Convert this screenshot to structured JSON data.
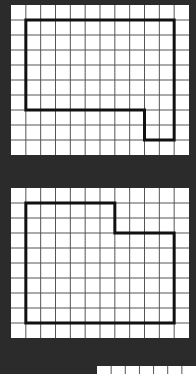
{
  "colors": {
    "background": "#2b2b2b",
    "grid_bg": "#ffffff",
    "grid_line": "#555555",
    "outline": "#111111"
  },
  "grid": {
    "cols": 12,
    "rows": 10
  },
  "panels": [
    {
      "id": "panel-1",
      "x": 11,
      "y": 5,
      "width": 178,
      "height": 150,
      "shape_points": [
        [
          1,
          1
        ],
        [
          11,
          1
        ],
        [
          11,
          9
        ],
        [
          9,
          9
        ],
        [
          9,
          7
        ],
        [
          1,
          7
        ]
      ]
    },
    {
      "id": "panel-2",
      "x": 11,
      "y": 188,
      "width": 178,
      "height": 150,
      "shape_points": [
        [
          1,
          1
        ],
        [
          7,
          1
        ],
        [
          7,
          3
        ],
        [
          11,
          3
        ],
        [
          11,
          9
        ],
        [
          1,
          9
        ]
      ]
    }
  ],
  "partial_panel": {
    "x": 97,
    "y": 366,
    "width": 99,
    "height": 8,
    "cols_visible": 7
  }
}
